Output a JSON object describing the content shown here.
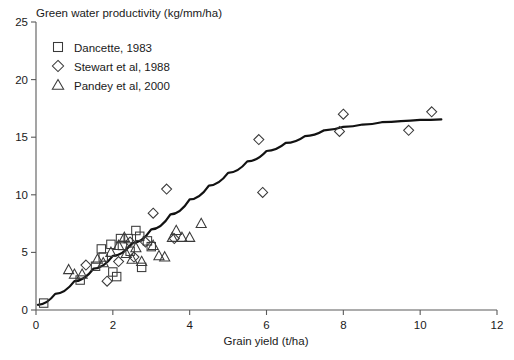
{
  "chart_data": {
    "type": "scatter",
    "title": "Green water productivity (kg/mm/ha)",
    "xlabel": "Grain yield (t/ha)",
    "ylabel": "Green water productivity (kg/mm/ha)",
    "xlim": [
      0,
      12
    ],
    "ylim": [
      0,
      25
    ],
    "xticks": [
      0,
      2,
      4,
      6,
      8,
      10,
      12
    ],
    "yticks": [
      0,
      5,
      10,
      15,
      20,
      25
    ],
    "grid": false,
    "legend_position": "top-left",
    "series": [
      {
        "name": "Dancette, 1983",
        "marker": "square",
        "points": [
          [
            0.2,
            0.6
          ],
          [
            1.15,
            2.6
          ],
          [
            1.55,
            3.8
          ],
          [
            1.7,
            5.3
          ],
          [
            1.75,
            4.6
          ],
          [
            1.95,
            5.7
          ],
          [
            2.0,
            3.3
          ],
          [
            2.1,
            2.9
          ],
          [
            2.2,
            6.2
          ],
          [
            2.25,
            5.6
          ],
          [
            2.4,
            6.2
          ],
          [
            2.45,
            5.1
          ],
          [
            2.6,
            6.9
          ],
          [
            2.7,
            6.4
          ],
          [
            2.75,
            3.7
          ],
          [
            2.9,
            6.0
          ],
          [
            3.0,
            5.5
          ]
        ]
      },
      {
        "name": "Stewart et al, 1988",
        "marker": "diamond",
        "points": [
          [
            1.3,
            3.9
          ],
          [
            1.85,
            2.5
          ],
          [
            2.15,
            4.2
          ],
          [
            2.45,
            5.9
          ],
          [
            2.55,
            4.6
          ],
          [
            2.85,
            5.9
          ],
          [
            3.05,
            8.4
          ],
          [
            3.4,
            10.5
          ],
          [
            3.6,
            6.2
          ],
          [
            5.8,
            14.8
          ],
          [
            5.9,
            10.2
          ],
          [
            7.9,
            15.5
          ],
          [
            8.0,
            17.0
          ],
          [
            9.7,
            15.6
          ],
          [
            10.3,
            17.2
          ]
        ]
      },
      {
        "name": "Pandey et al, 2000",
        "marker": "triangle",
        "points": [
          [
            0.85,
            3.5
          ],
          [
            1.0,
            3.1
          ],
          [
            1.2,
            3.1
          ],
          [
            1.6,
            4.4
          ],
          [
            1.75,
            4.1
          ],
          [
            1.95,
            5.0
          ],
          [
            2.15,
            5.6
          ],
          [
            2.3,
            6.3
          ],
          [
            2.35,
            4.9
          ],
          [
            2.5,
            4.4
          ],
          [
            2.6,
            5.4
          ],
          [
            2.75,
            4.2
          ],
          [
            3.05,
            5.6
          ],
          [
            3.2,
            4.7
          ],
          [
            3.35,
            4.6
          ],
          [
            3.55,
            6.3
          ],
          [
            3.65,
            6.9
          ],
          [
            3.8,
            6.3
          ],
          [
            4.0,
            6.3
          ],
          [
            4.3,
            7.5
          ]
        ]
      }
    ],
    "fit_curve": {
      "name": "fitted saturation curve",
      "points": [
        [
          0.05,
          0.45
        ],
        [
          0.5,
          1.4
        ],
        [
          1.0,
          2.5
        ],
        [
          1.5,
          3.6
        ],
        [
          2.0,
          4.7
        ],
        [
          2.5,
          5.8
        ],
        [
          3.0,
          7.0
        ],
        [
          3.5,
          8.3
        ],
        [
          4.0,
          9.6
        ],
        [
          4.5,
          10.8
        ],
        [
          5.0,
          11.9
        ],
        [
          5.5,
          12.9
        ],
        [
          6.0,
          13.8
        ],
        [
          6.5,
          14.5
        ],
        [
          7.0,
          15.1
        ],
        [
          7.5,
          15.6
        ],
        [
          8.0,
          15.9
        ],
        [
          8.5,
          16.1
        ],
        [
          9.0,
          16.3
        ],
        [
          9.5,
          16.4
        ],
        [
          10.0,
          16.5
        ],
        [
          10.55,
          16.55
        ]
      ]
    }
  },
  "legend": {
    "items": [
      {
        "label": "Dancette, 1983",
        "marker": "square"
      },
      {
        "label": "Stewart et al, 1988",
        "marker": "diamond"
      },
      {
        "label": "Pandey et al, 2000",
        "marker": "triangle"
      }
    ]
  },
  "axes": {
    "x_tick_labels": [
      "0",
      "2",
      "4",
      "6",
      "8",
      "10",
      "12"
    ],
    "y_tick_labels": [
      "0",
      "5",
      "10",
      "15",
      "20",
      "25"
    ]
  },
  "colors": {
    "marker_stroke": "#3a3a3a",
    "curve": "#121212",
    "axis": "#5a5a5a",
    "text": "#1a1a1a",
    "background": "#ffffff"
  }
}
